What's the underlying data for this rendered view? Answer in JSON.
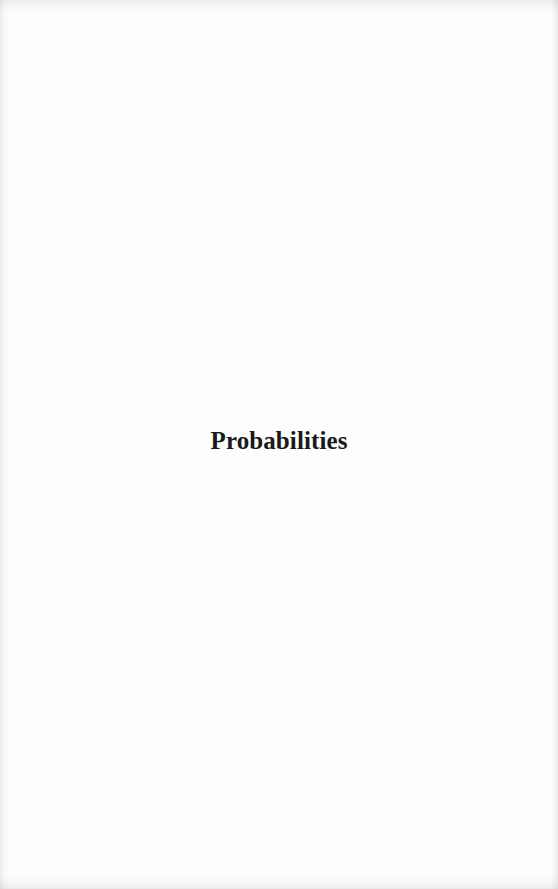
{
  "page": {
    "title": "Probabilities"
  }
}
